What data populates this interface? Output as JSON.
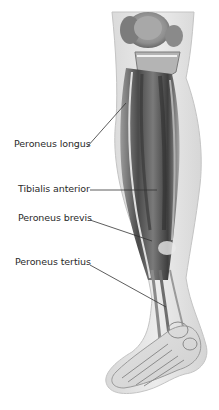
{
  "diagram": {
    "colors": {
      "background": "#ffffff",
      "skin": "#e6e6e6",
      "muscle_dark": "#555555",
      "bone": "#c9c9c9",
      "label_text": "#2a2a2a",
      "leader_line": "#333333"
    },
    "labels": [
      {
        "id": "peroneus-longus",
        "text": "Peroneus longus",
        "x": 14,
        "y": 138,
        "line": [
          87,
          147,
          126,
          103
        ]
      },
      {
        "id": "tibialis-anterior",
        "text": "Tibialis anterior",
        "x": 18,
        "y": 183,
        "line": [
          90,
          190,
          157,
          190
        ]
      },
      {
        "id": "peroneus-brevis",
        "text": "Peroneus brevis",
        "x": 18,
        "y": 212,
        "line": [
          90,
          220,
          152,
          241
        ]
      },
      {
        "id": "peroneus-tertius",
        "text": "Peroneus tertius",
        "x": 15,
        "y": 256,
        "line": [
          90,
          265,
          166,
          307
        ]
      }
    ]
  }
}
